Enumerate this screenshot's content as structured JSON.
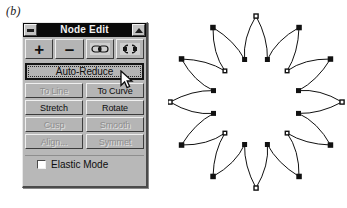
{
  "figure": {
    "label": "(b)"
  },
  "dialog": {
    "title": "Node Edit",
    "minimize_glyph": "minimize-box",
    "maximize_glyph": "maximize-box",
    "toolbar": [
      {
        "name": "add-node-button",
        "glyph": "+",
        "icon": "plus-icon",
        "enabled": true
      },
      {
        "name": "delete-node-button",
        "glyph": "–",
        "icon": "minus-icon",
        "enabled": true
      },
      {
        "name": "join-nodes-button",
        "glyph": "join-nodes",
        "icon": "join-nodes-icon",
        "enabled": true
      },
      {
        "name": "break-node-button",
        "glyph": "break-node",
        "icon": "break-node-icon",
        "enabled": true
      }
    ],
    "default_button": {
      "label": "Auto-Reduce",
      "focused": true,
      "enabled": true
    },
    "button_rows": [
      [
        {
          "label": "To Line",
          "enabled": false
        },
        {
          "label": "To Curve",
          "enabled": true
        }
      ],
      [
        {
          "label": "Stretch",
          "enabled": true
        },
        {
          "label": "Rotate",
          "enabled": true
        }
      ],
      [
        {
          "label": "Cusp",
          "enabled": false
        },
        {
          "label": "Smooth",
          "enabled": false
        }
      ],
      [
        {
          "label": "Align...",
          "enabled": false
        },
        {
          "label": "Symmet",
          "enabled": false
        }
      ]
    ],
    "elastic_mode": {
      "label": "Elastic Mode",
      "checked": false
    }
  },
  "cursor": {
    "icon": "arrow-pointer-icon",
    "x": 120,
    "y": 70
  },
  "canvas": {
    "name": "star-path-shape",
    "description": "12-point star path with editable node markers",
    "points": 12,
    "center": {
      "x": 88,
      "y": 96
    },
    "outer_radius": 86,
    "inner_radius": 44,
    "node_marker": "square-node-handle",
    "stroke": "#111111",
    "fill": "none"
  },
  "colors": {
    "dialog_face": "#b8b8b8",
    "button_face": "#b5b5b5",
    "titlebar": "#0a0a0a",
    "titlebar_text": "#f2f2f2",
    "text": "#0d0d0d",
    "disabled_text": "#8e8e8e",
    "page_background": "#ffffff",
    "path_stroke": "#111111"
  }
}
